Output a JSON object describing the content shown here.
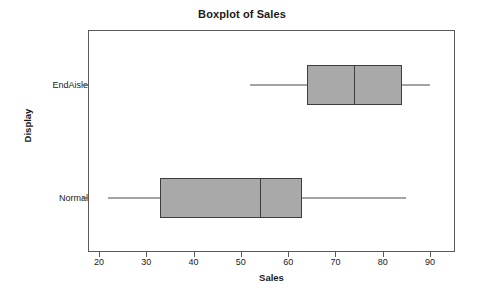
{
  "chart_data": {
    "type": "boxplot",
    "title": "Boxplot of Sales",
    "xlabel": "Sales",
    "ylabel": "Display",
    "xlim": [
      18,
      95
    ],
    "xticks": [
      20,
      30,
      40,
      50,
      60,
      70,
      80,
      90
    ],
    "xtick_labels": [
      "20",
      "30",
      "40",
      "50",
      "60",
      "70",
      "80",
      "90"
    ],
    "categories": [
      "EndAisle",
      "Normal"
    ],
    "orientation": "horizontal",
    "grid": false,
    "legend": "none",
    "box_fill": "#a9a9a9",
    "box_edge": "#3d3d3d",
    "boxes": [
      {
        "category": "EndAisle",
        "whisker_low": 52,
        "q1": 64,
        "median": 74,
        "q3": 84,
        "whisker_high": 90,
        "outliers": []
      },
      {
        "category": "Normal",
        "whisker_low": 22,
        "q1": 33,
        "median": 54,
        "q3": 63,
        "whisker_high": 85,
        "outliers": []
      }
    ]
  },
  "axis": {
    "y_categories": [
      {
        "label": "EndAisle"
      },
      {
        "label": "Normal"
      }
    ]
  }
}
